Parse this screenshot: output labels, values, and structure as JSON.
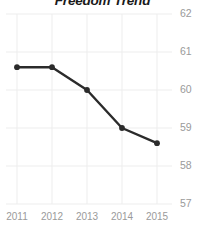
{
  "chart_data": {
    "type": "line",
    "title": "Freedom Trend",
    "xlabel": "",
    "ylabel": "",
    "categories": [
      "2011",
      "2012",
      "2013",
      "2014",
      "2015"
    ],
    "x": [
      2011,
      2012,
      2013,
      2014,
      2015
    ],
    "values": [
      60.6,
      60.6,
      60.0,
      59.0,
      58.6
    ],
    "series": [
      {
        "name": "Freedom Score",
        "values": [
          60.6,
          60.6,
          60.0,
          59.0,
          58.6
        ]
      }
    ],
    "ylim": [
      57,
      62
    ],
    "xlim": [
      2011,
      2015
    ],
    "yticks": [
      62,
      61,
      60,
      59,
      58,
      57
    ],
    "ytick_labels": [
      "62",
      "61",
      "60",
      "59",
      "58",
      "57"
    ],
    "xticks": [
      2011,
      2012,
      2013,
      2014,
      2015
    ],
    "xtick_labels": [
      "2011",
      "2012",
      "2013",
      "2014",
      "2015"
    ],
    "y_axis_position": "right",
    "grid": true,
    "grid_axis": "both",
    "legend": false,
    "legend_position": "none",
    "markers": true,
    "colors": {
      "line": "#2b2b2b",
      "marker": "#2b2b2b",
      "grid": "#ededed",
      "tick_label": "#9a9a9a",
      "title": "#1a1a1a",
      "background": "#ffffff"
    }
  }
}
